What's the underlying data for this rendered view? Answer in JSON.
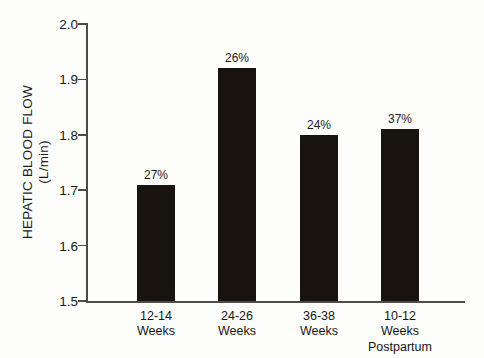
{
  "chart_data": {
    "type": "bar",
    "title": "",
    "subtitle": "",
    "xlabel": "",
    "ylabel": "HEPATIC BLOOD FLOW (L/min)",
    "ylabel_line1": "HEPATIC BLOOD FLOW",
    "ylabel_line2": "(L/min)",
    "categories": [
      "12-14 Weeks",
      "24-26 Weeks",
      "36-38 Weeks",
      "10-12 Weeks Postpartum"
    ],
    "category_lines": [
      [
        "12-14",
        "Weeks"
      ],
      [
        "24-26",
        "Weeks"
      ],
      [
        "36-38",
        "Weeks"
      ],
      [
        "10-12",
        "Weeks",
        "Postpartum"
      ]
    ],
    "values": [
      1.71,
      1.92,
      1.8,
      1.81
    ],
    "point_labels": [
      "27%",
      "26%",
      "24%",
      "37%"
    ],
    "ylim": [
      1.5,
      2.0
    ],
    "ytick_labels": [
      "1.5",
      "1.6",
      "1.7",
      "1.8",
      "1.9",
      "2.0"
    ],
    "ytick_values": [
      1.5,
      1.6,
      1.7,
      1.8,
      1.9,
      2.0
    ],
    "grid": false,
    "legend": null,
    "bar_color": "#191310",
    "axis_color": "#4c4c4c",
    "text_color": "#171717",
    "background_color": "#fdfdfb"
  }
}
